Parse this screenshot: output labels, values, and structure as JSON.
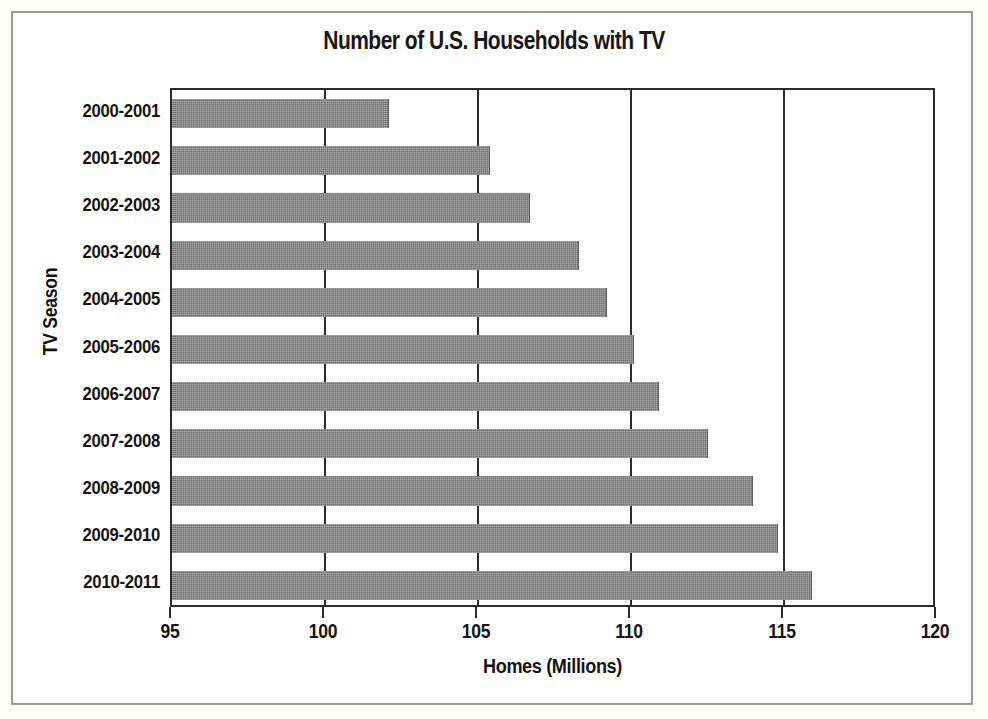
{
  "figure": {
    "frame_border_color": "#9a9a9a",
    "background": "#ffffff"
  },
  "chart_data": {
    "type": "bar",
    "orientation": "horizontal",
    "title": "Number of U.S. Households with TV",
    "xlabel": "Homes (Millions)",
    "ylabel": "TV Season",
    "categories": [
      "2000-2001",
      "2001-2002",
      "2002-2003",
      "2003-2004",
      "2004-2005",
      "2005-2006",
      "2006-2007",
      "2007-2008",
      "2008-2009",
      "2009-2010",
      "2010-2011"
    ],
    "values": [
      102.1,
      105.4,
      106.7,
      108.3,
      109.2,
      110.1,
      110.9,
      112.5,
      114.0,
      114.8,
      115.9
    ],
    "xlim": [
      95,
      120
    ],
    "xticks": [
      95,
      100,
      105,
      110,
      115,
      120
    ],
    "xtick_labels": [
      "95",
      "100",
      "105",
      "110",
      "115",
      "120"
    ],
    "grid": "vertical",
    "gridline_values": [
      100,
      105,
      110,
      115
    ],
    "legend": null,
    "bar_color": "#6f6f6f",
    "axis_color": "#2b2b2b"
  }
}
